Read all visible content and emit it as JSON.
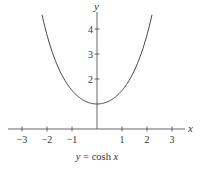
{
  "chart_data": {
    "type": "line",
    "title": "",
    "caption": "y = cosh x",
    "caption_parts": {
      "lhs": "y",
      "eq": " = cosh ",
      "var": "x"
    },
    "xlabel": "x",
    "ylabel": "y",
    "xlim": [
      -3.5,
      3.7
    ],
    "ylim": [
      0,
      4.6
    ],
    "x_ticks": [
      -3,
      -2,
      -1,
      1,
      2,
      3
    ],
    "x_tick_labels": [
      "−3",
      "−2",
      "−1",
      "1",
      "2",
      "3"
    ],
    "y_ticks": [
      2,
      3,
      4
    ],
    "y_tick_labels": [
      "2",
      "3",
      "4"
    ],
    "grid": false,
    "legend": null,
    "series": [
      {
        "name": "cosh x",
        "function": "cosh(x)",
        "x_range": [
          -2.2,
          2.2
        ],
        "x": [
          -2.2,
          -2.0,
          -1.5,
          -1.0,
          -0.5,
          0,
          0.5,
          1.0,
          1.5,
          2.0,
          2.2
        ],
        "y": [
          4.57,
          3.76,
          2.35,
          1.54,
          1.13,
          1.0,
          1.13,
          1.54,
          2.35,
          3.76,
          4.57
        ]
      }
    ],
    "color": "#444444"
  }
}
